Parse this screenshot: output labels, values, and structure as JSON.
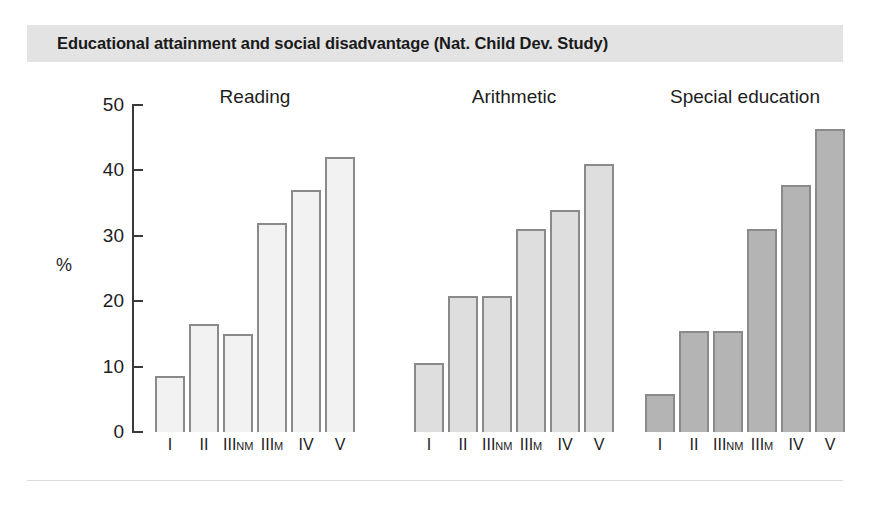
{
  "title": "Educational attainment and social disadvantage (Nat. Child Dev. Study)",
  "axis": {
    "y_title": "%",
    "y_ticks": [
      "0",
      "10",
      "20",
      "30",
      "40",
      "50"
    ]
  },
  "groups": [
    {
      "label": "Reading",
      "color": "#f2f2f2"
    },
    {
      "label": "Arithmetic",
      "color": "#dedede"
    },
    {
      "label": "Special education",
      "color": "#b4b4b4"
    }
  ],
  "categories": [
    {
      "main": "I",
      "sub": ""
    },
    {
      "main": "II",
      "sub": ""
    },
    {
      "main": "III",
      "sub": "NM"
    },
    {
      "main": "III",
      "sub": "M"
    },
    {
      "main": "IV",
      "sub": ""
    },
    {
      "main": "V",
      "sub": ""
    }
  ],
  "chart_data": {
    "type": "bar",
    "title": "Educational attainment and social disadvantage (Nat. Child Dev. Study)",
    "xlabel": "",
    "ylabel": "%",
    "ylim": [
      0,
      50
    ],
    "yticks": [
      0,
      10,
      20,
      30,
      40,
      50
    ],
    "grid": false,
    "legend": "none",
    "categories": [
      "I",
      "II",
      "IIINM",
      "IIIM",
      "IV",
      "V"
    ],
    "category_note": "Registrar General social class of father",
    "series": [
      {
        "name": "Reading",
        "color": "#f2f2f2",
        "values": [
          8.5,
          16.5,
          15.0,
          32.0,
          37.0,
          42.0
        ]
      },
      {
        "name": "Arithmetic",
        "color": "#dedede",
        "values": [
          10.5,
          20.8,
          20.8,
          31.0,
          34.0,
          41.0
        ]
      },
      {
        "name": "Special education",
        "color": "#b4b4b4",
        "values": [
          5.8,
          15.5,
          15.5,
          31.0,
          37.8,
          46.3
        ]
      }
    ]
  }
}
